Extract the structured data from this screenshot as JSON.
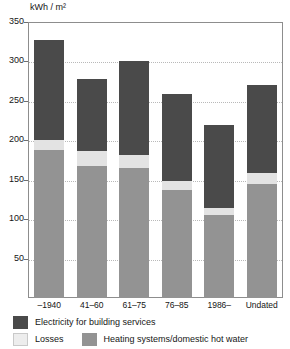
{
  "chart_data": {
    "type": "bar",
    "stacked": true,
    "title": "",
    "subtitle": "",
    "xlabel": "",
    "ylabel": "kWh / m²",
    "ylim": [
      0,
      350
    ],
    "ytick_values": [
      50,
      100,
      150,
      200,
      250,
      300,
      350
    ],
    "ytick_labels": [
      "50",
      "100",
      "150",
      "200",
      "250",
      "300",
      "350"
    ],
    "grid": true,
    "grid_axis": "y",
    "legend_position": "bottom",
    "categories": [
      "–1940",
      "41–60",
      "61–75",
      "76–85",
      "1986–",
      "Undated"
    ],
    "series": [
      {
        "name": "Heating systems/domestic hot water",
        "color": "#939393",
        "values": [
          188,
          168,
          165,
          137,
          105,
          145
        ]
      },
      {
        "name": "Losses",
        "color": "#e3e3e3",
        "values": [
          13,
          18,
          16,
          11,
          9,
          14
        ]
      },
      {
        "name": "Electricity for building services",
        "color": "#4a4a4a",
        "values": [
          126,
          92,
          119,
          111,
          106,
          111
        ]
      }
    ],
    "stack_order_bottom_to_top": [
      "Heating systems/domestic hot water",
      "Losses",
      "Electricity for building services"
    ],
    "totals": [
      327,
      278,
      300,
      259,
      220,
      270
    ]
  },
  "axis": {
    "y_title": "kWh / m²"
  },
  "legend": {
    "row1": [
      {
        "label": "Electricity for building services",
        "color": "#4a4a4a"
      }
    ],
    "row2": [
      {
        "label": "Losses",
        "color": "#e3e3e3"
      },
      {
        "label": "Heating systems/domestic hot water",
        "color": "#939393"
      }
    ]
  }
}
